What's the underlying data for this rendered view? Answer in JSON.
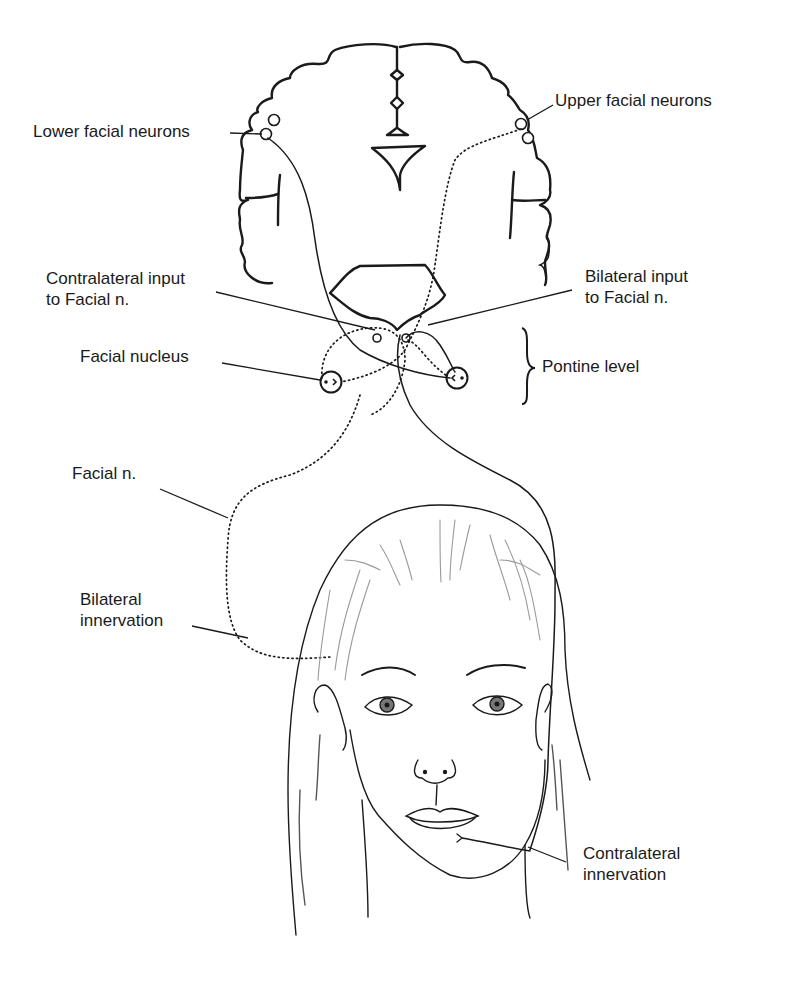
{
  "figure": {
    "colors": {
      "ink": "#1a1a1a",
      "background": "#ffffff",
      "hair_light": "#9a9a9a"
    }
  },
  "labels": {
    "lower_facial_neurons": "Lower facial neurons",
    "upper_facial_neurons": "Upper facial neurons",
    "contralateral_input": [
      "Contralateral input",
      "to Facial n."
    ],
    "bilateral_input": [
      "Bilateral input",
      "to Facial n."
    ],
    "facial_nucleus": "Facial nucleus",
    "pontine_level": "Pontine level",
    "facial_nerve": "Facial n.",
    "bilateral_innervation": [
      "Bilateral",
      "innervation"
    ],
    "contralateral_innervation": [
      "Contralateral",
      "innervation"
    ]
  },
  "legend_semantics": {
    "solid_line": "contralateral pathway (lower face)",
    "dotted_line": "bilateral pathway (upper face)"
  }
}
